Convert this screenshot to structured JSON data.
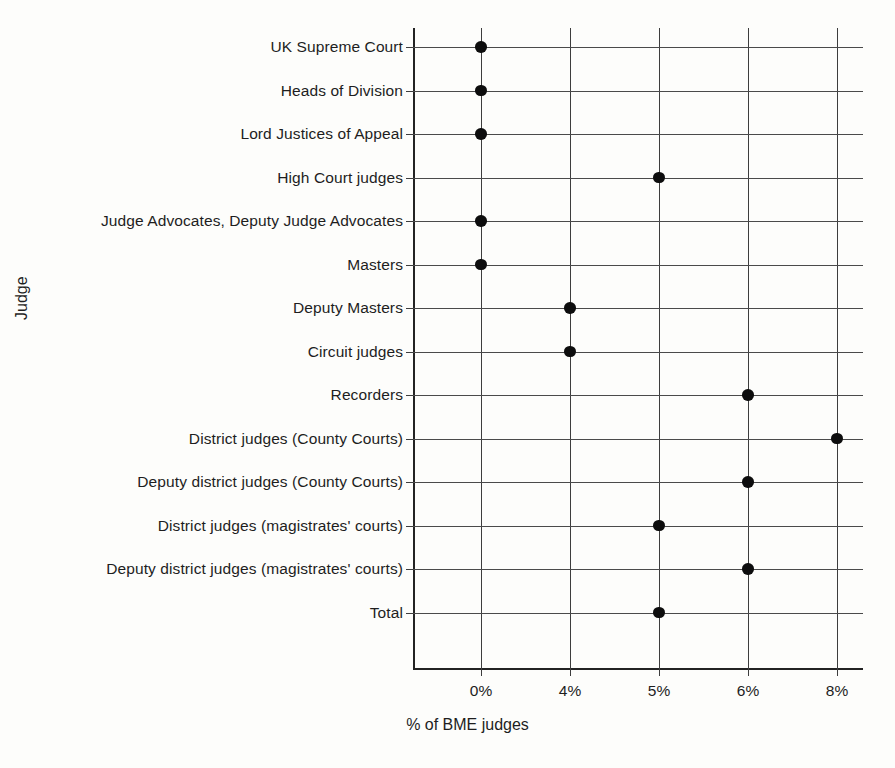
{
  "chart_data": {
    "type": "scatter",
    "title": "",
    "xlabel": "% of BME judges",
    "ylabel": "Judge",
    "orientation": "horizontal",
    "grid": true,
    "legend": false,
    "x_tick_labels": [
      "0%",
      "4%",
      "5%",
      "6%",
      "8%"
    ],
    "x_tick_values": [
      0,
      4,
      5,
      6,
      8
    ],
    "x_axis_scale": "categorical-even-spacing",
    "categories": [
      "UK Supreme Court",
      "Heads of Division",
      "Lord Justices of Appeal",
      "High Court judges",
      "Judge Advocates, Deputy Judge Advocates",
      "Masters",
      "Deputy Masters",
      "Circuit judges",
      "Recorders",
      "District judges (County Courts)",
      "Deputy district judges (County Courts)",
      "District judges (magistrates' courts)",
      "Deputy district judges (magistrates' courts)",
      "Total"
    ],
    "values": [
      0,
      0,
      0,
      5,
      0,
      0,
      4,
      4,
      6,
      8,
      6,
      5,
      6,
      5
    ],
    "value_labels": [
      "0%",
      "0%",
      "0%",
      "5%",
      "0%",
      "0%",
      "4%",
      "4%",
      "6%",
      "8%",
      "6%",
      "5%",
      "6%",
      "5%"
    ],
    "marker": "filled-circle",
    "marker_color": "#0d0d0d",
    "gridline_color": "#3d3d3d",
    "background_color": "#fdfdfb"
  }
}
